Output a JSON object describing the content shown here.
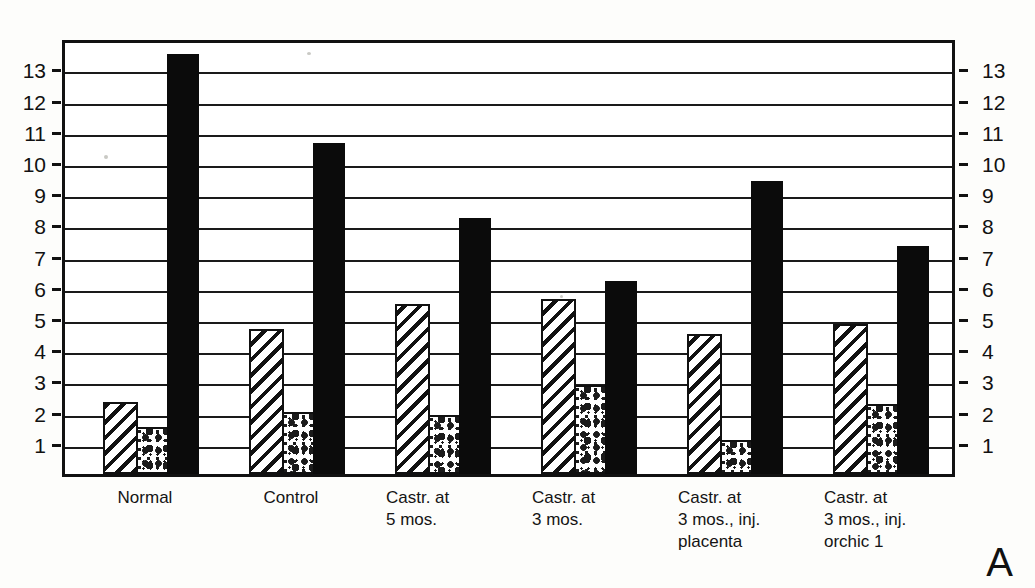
{
  "panel_label": "A",
  "axis": {
    "left_ticks": [
      13,
      12,
      11,
      10,
      9,
      8,
      7,
      6,
      5,
      4,
      3,
      2,
      1
    ],
    "right_ticks": [
      13,
      12,
      11,
      10,
      9,
      8,
      7,
      6,
      5,
      4,
      3,
      2,
      1
    ],
    "min": 0,
    "max": 14
  },
  "categories": [
    "Normal",
    "Control",
    "Castr. at\n5 mos.",
    "Castr. at\n3 mos.",
    "Castr. at\n3 mos., inj.\nplacenta",
    "Castr. at\n3 mos., inj.\norchic 1"
  ],
  "series_names": [
    "hatched",
    "stippled",
    "solid-black"
  ],
  "chart_data": {
    "type": "bar",
    "title": "",
    "xlabel": "",
    "ylabel": "",
    "ylim": [
      0,
      14
    ],
    "grid": true,
    "legend": "none",
    "categories": [
      "Normal",
      "Control",
      "Castr. at 5 mos.",
      "Castr. at 3 mos.",
      "Castr. at 3 mos., inj. placenta",
      "Castr. at 3 mos., inj. orchic 1"
    ],
    "series": [
      {
        "name": "hatched",
        "pattern": "diagonal-hatch",
        "values": [
          2.3,
          4.65,
          5.45,
          5.6,
          4.5,
          4.8
        ]
      },
      {
        "name": "stippled",
        "pattern": "dotted",
        "values": [
          1.5,
          2.0,
          1.9,
          2.85,
          1.1,
          2.25
        ]
      },
      {
        "name": "solid-black",
        "pattern": "solid",
        "values": [
          13.45,
          10.6,
          8.2,
          6.2,
          9.4,
          7.3
        ]
      }
    ],
    "yticks": [
      1,
      2,
      3,
      4,
      5,
      6,
      7,
      8,
      9,
      10,
      11,
      12,
      13
    ],
    "annotations": [
      "A"
    ]
  },
  "colors": {
    "ink": "#111111",
    "paper": "#fdfdfb",
    "plot_bg": "#ffffff",
    "solid_bar": "#0b0b0b"
  }
}
